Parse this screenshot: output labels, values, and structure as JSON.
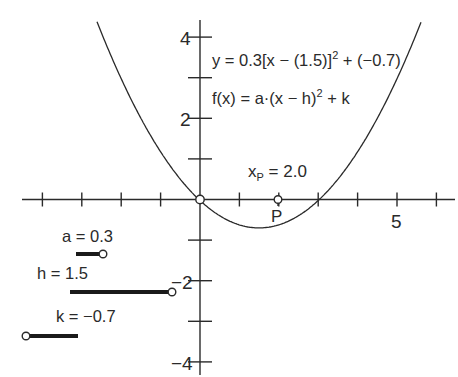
{
  "figure": {
    "equation_instance": "y = 0.3[x − (1.5)]² + (−0.7)",
    "equation_general": "f(x) = a·(x − h)² + k",
    "point_label": "P",
    "point_value_label": "x",
    "point_value_sub": "P",
    "point_value_text": " = 2.0"
  },
  "axes": {
    "x_tick_labels": [
      {
        "value": 5,
        "label": "5"
      }
    ],
    "y_tick_labels": [
      {
        "value": 4,
        "label": "4"
      },
      {
        "value": 2,
        "label": "2"
      },
      {
        "value": -2,
        "label": "−2"
      },
      {
        "value": -4,
        "label": "−4"
      }
    ],
    "x_range": [
      -4.5,
      6.5
    ],
    "y_range": [
      -4.4,
      4.4
    ]
  },
  "sliders": [
    {
      "name": "a",
      "label": "a = 0.3",
      "value": 0.3
    },
    {
      "name": "h",
      "label": "h = 1.5",
      "value": 1.5
    },
    {
      "name": "k",
      "label": "k = −0.7",
      "value": -0.7
    }
  ],
  "chart_data": {
    "type": "line",
    "title": "",
    "function": "y = 0.3(x - 1.5)^2 - 0.7",
    "params": {
      "a": 0.3,
      "h": 1.5,
      "k": -0.7
    },
    "vertex": [
      1.5,
      -0.7
    ],
    "points": [
      {
        "label": "origin",
        "x": 0,
        "y": 0
      },
      {
        "label": "P",
        "x": 2.0,
        "y": 0
      }
    ],
    "x_ticks": [
      -4,
      -3,
      -2,
      -1,
      0,
      1,
      2,
      3,
      4,
      5,
      6
    ],
    "y_ticks": [
      -4,
      -3,
      -2,
      -1,
      0,
      1,
      2,
      3,
      4
    ],
    "xlabel": "",
    "ylabel": "",
    "grid": false
  }
}
